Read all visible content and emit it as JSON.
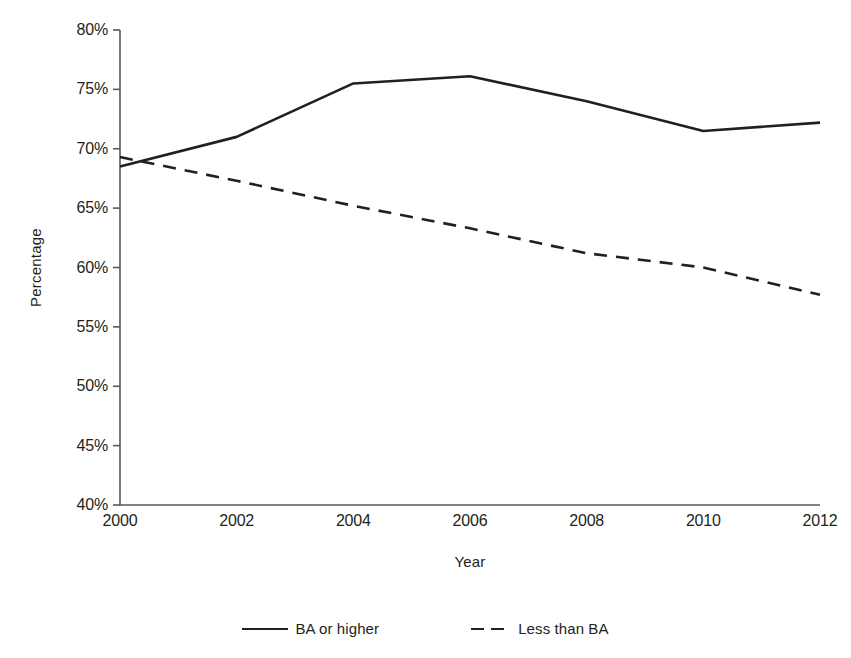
{
  "chart_data": {
    "type": "line",
    "title": "",
    "xlabel": "Year",
    "ylabel": "Percentage",
    "x": [
      2000,
      2002,
      2004,
      2006,
      2008,
      2010,
      2012
    ],
    "xtick_labels": [
      "2000",
      "2002",
      "2004",
      "2006",
      "2008",
      "2010",
      "2012"
    ],
    "ytick_labels": [
      "80%",
      "75%",
      "70%",
      "65%",
      "60%",
      "55%",
      "50%",
      "45%",
      "40%"
    ],
    "ytick_values": [
      80,
      75,
      70,
      65,
      60,
      55,
      50,
      45,
      40
    ],
    "xlim": [
      2000,
      2012
    ],
    "ylim": [
      40,
      80
    ],
    "grid": false,
    "legend_position": "bottom",
    "series": [
      {
        "name": "BA or higher",
        "style": "solid",
        "color": "#231f20",
        "values": [
          68.5,
          71.0,
          75.5,
          76.1,
          74.0,
          71.5,
          72.2
        ]
      },
      {
        "name": "Less than BA",
        "style": "dashed",
        "color": "#231f20",
        "values": [
          69.3,
          67.3,
          65.2,
          63.3,
          61.2,
          60.0,
          57.7
        ]
      }
    ]
  },
  "legend": {
    "items": [
      {
        "label": "BA or higher",
        "style": "solid"
      },
      {
        "label": "Less than BA",
        "style": "dashed"
      }
    ]
  }
}
